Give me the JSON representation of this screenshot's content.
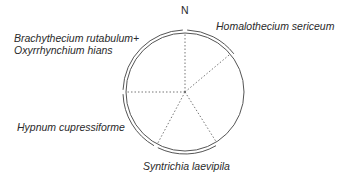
{
  "diagram": {
    "compass_label": "N",
    "center": {
      "x": 185,
      "y": 92
    },
    "radius_inner": 59,
    "radius_outer": 62,
    "line_color": "#555555",
    "text_color": "#2a2a2a",
    "radii_degrees_clockwise_from_north": [
      0,
      50,
      148,
      208,
      270
    ],
    "arcs": [
      {
        "species": "Homalothecium sericeum",
        "start_deg": 2,
        "end_deg": 52
      },
      {
        "species": "Syntrichia laevipila",
        "start_deg": 150,
        "end_deg": 206
      },
      {
        "species": "Hypnum cupressiforme",
        "start_deg": 210,
        "end_deg": 268
      },
      {
        "species": "Brachythecium rutabulum+ Oxyrrhynchium hians",
        "start_deg": 272,
        "end_deg": 358
      }
    ],
    "labels": {
      "homalothecium": "Homalothecium sericeum",
      "brachythecium_line1": "Brachythecium  rutabulum+",
      "brachythecium_line2": "Oxyrrhynchium hians",
      "hypnum": "Hypnum cupressiforme",
      "syntrichia": "Syntrichia laevipila"
    }
  }
}
